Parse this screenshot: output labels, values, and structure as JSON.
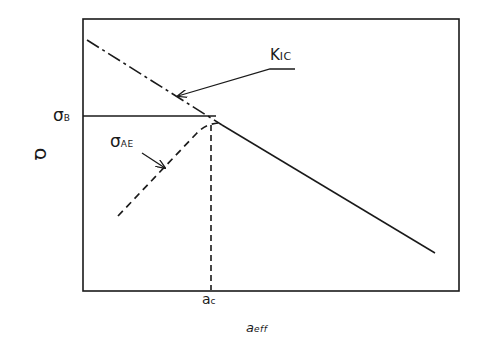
{
  "diagram": {
    "type": "fracture-stress-vs-crack-length",
    "frame": {
      "left": 83,
      "top": 19,
      "right": 459,
      "bottom": 291
    },
    "colors": {
      "line": "#1a1a1a",
      "background": "#ffffff"
    },
    "labels": {
      "y_axis": "σ",
      "x_axis_main": "a",
      "x_axis_sub": "eff",
      "sigma_b_main": "σ",
      "sigma_b_sub": "B",
      "sigma_ae_main": "σ",
      "sigma_ae_sub": "AE",
      "kic_main": "K",
      "kic_sub": "IC",
      "ac_main": "a",
      "ac_sub": "c"
    },
    "curves": [
      {
        "name": "KIC line (dash-dot segment)",
        "style": "dash-dot",
        "points": [
          [
            87,
            40
          ],
          [
            222,
            125
          ]
        ]
      },
      {
        "name": "KIC line (solid segment)",
        "style": "solid",
        "points": [
          [
            222,
            125
          ],
          [
            435,
            253
          ]
        ]
      },
      {
        "name": "σB horizontal",
        "style": "solid",
        "points": [
          [
            83,
            116
          ],
          [
            215,
            116
          ]
        ]
      },
      {
        "name": "σAE curve",
        "style": "dashed",
        "points": [
          [
            118,
            216
          ],
          [
            200,
            130
          ],
          [
            216,
            123
          ]
        ]
      },
      {
        "name": "ac vertical",
        "style": "dashed",
        "points": [
          [
            211,
            124
          ],
          [
            211,
            291
          ]
        ]
      }
    ],
    "arrows": [
      {
        "name": "KIC leader",
        "from": [
          300,
          69
        ],
        "to": [
          178,
          96
        ],
        "label_underline": [
          [
            270,
            69
          ],
          [
            300,
            69
          ]
        ]
      },
      {
        "name": "σAE leader",
        "from": [
          143,
          154
        ],
        "to": [
          165,
          169
        ]
      }
    ]
  }
}
